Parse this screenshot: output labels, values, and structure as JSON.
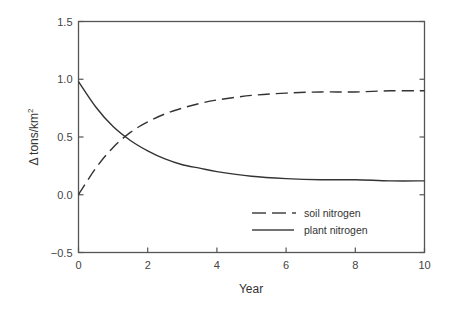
{
  "chart_data": {
    "type": "line",
    "title": "",
    "xlabel": "Year",
    "ylabel": "Δ tons/km",
    "ylabel_superscript": "2",
    "xlim": [
      0,
      10
    ],
    "ylim": [
      -0.5,
      1.5
    ],
    "xticks": [
      "0",
      "2",
      "4",
      "6",
      "8",
      "10"
    ],
    "yticks": [
      "1.5",
      "1.0",
      "0.5",
      "0.0",
      "−0.5"
    ],
    "grid": false,
    "legend_position": "lower right",
    "x": [
      0,
      0.5,
      1,
      1.5,
      2,
      2.5,
      3,
      3.5,
      4,
      5,
      6,
      7,
      8,
      9,
      10
    ],
    "series": [
      {
        "name": "soil nitrogen",
        "style": "dashed",
        "values": [
          0.0,
          0.23,
          0.41,
          0.54,
          0.63,
          0.7,
          0.75,
          0.79,
          0.82,
          0.86,
          0.88,
          0.89,
          0.89,
          0.9,
          0.9
        ]
      },
      {
        "name": "plant nitrogen",
        "style": "solid",
        "values": [
          0.98,
          0.76,
          0.59,
          0.47,
          0.38,
          0.31,
          0.26,
          0.23,
          0.2,
          0.16,
          0.14,
          0.13,
          0.13,
          0.12,
          0.12
        ]
      }
    ]
  },
  "legend": {
    "items": [
      {
        "label": "soil nitrogen"
      },
      {
        "label": "plant nitrogen"
      }
    ]
  }
}
